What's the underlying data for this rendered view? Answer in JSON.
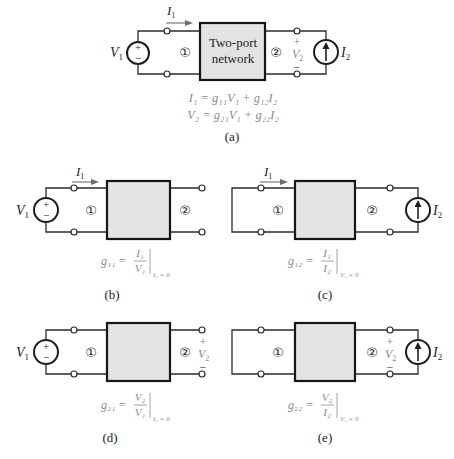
{
  "figure": {
    "panel_a": {
      "caption": "(a)",
      "network_label_line1": "Two-port",
      "network_label_line2": "network",
      "port1": "①",
      "port2": "②",
      "v1": {
        "var": "V",
        "sub": "1"
      },
      "source_plus": "+",
      "source_minus": "−",
      "i1": {
        "var": "I",
        "sub": "1"
      },
      "v2": {
        "plus": "+",
        "var": "V",
        "sub": "2",
        "minus": "−"
      },
      "i2": {
        "var": "I",
        "sub": "2"
      },
      "equations": [
        "I₁ = g₁₁V₁ + g₁₂I₂",
        "V₂ = g₂₁V₁ + g₂₂I₂"
      ]
    },
    "panel_b": {
      "caption": "(b)",
      "port1": "①",
      "port2": "②",
      "v1": {
        "var": "V",
        "sub": "1"
      },
      "source_plus": "+",
      "source_minus": "−",
      "i1": {
        "var": "I",
        "sub": "1"
      },
      "equation": {
        "lhs": "g₁₁ =",
        "num": "I₁",
        "den": "V₁",
        "cond": "I₂ = 0"
      }
    },
    "panel_c": {
      "caption": "(c)",
      "port1": "①",
      "port2": "②",
      "i1": {
        "var": "I",
        "sub": "1"
      },
      "i2": {
        "var": "I",
        "sub": "2"
      },
      "equation": {
        "lhs": "g₁₂ =",
        "num": "I₁",
        "den": "I₂",
        "cond": "V₁ = 0"
      }
    },
    "panel_d": {
      "caption": "(d)",
      "port1": "①",
      "port2": "②",
      "v1": {
        "var": "V",
        "sub": "1"
      },
      "source_plus": "+",
      "source_minus": "−",
      "v2": {
        "plus": "+",
        "var": "V",
        "sub": "2",
        "minus": "−"
      },
      "equation": {
        "lhs": "g₂₁ =",
        "num": "V₂",
        "den": "V₁",
        "cond": "I₂ = 0"
      }
    },
    "panel_e": {
      "caption": "(e)",
      "port1": "①",
      "port2": "②",
      "i2": {
        "var": "I",
        "sub": "2"
      },
      "v2": {
        "plus": "+",
        "var": "V",
        "sub": "2",
        "minus": "−"
      },
      "equation": {
        "lhs": "g₂₂ =",
        "num": "V₂",
        "den": "I₂",
        "cond": "V₁ = 0"
      }
    }
  }
}
